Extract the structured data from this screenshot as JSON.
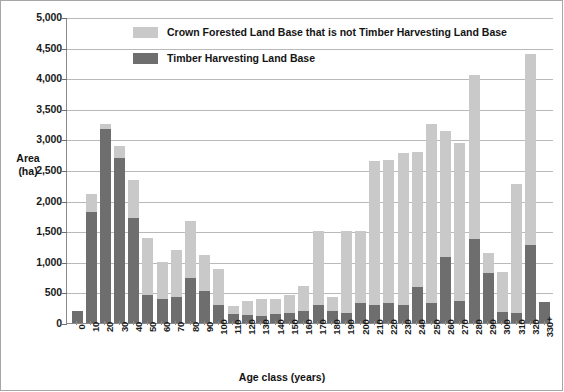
{
  "chart_data": {
    "type": "bar",
    "subtype": "stacked",
    "title": "",
    "xlabel": "Age class (years)",
    "ylabel": "Area\n(ha)",
    "ylabel_line1": "Area",
    "ylabel_line2": "(ha)",
    "ylim": [
      0,
      5000
    ],
    "ytick_step": 500,
    "grid": "horizontal",
    "legend_position": "inside-top-left",
    "ytick_labels": [
      "5,000",
      "4,500",
      "4,000",
      "3,500",
      "3,000",
      "2,500",
      "2,000",
      "1,500",
      "1,000",
      "500",
      "0"
    ],
    "ytick_values": [
      5000,
      4500,
      4000,
      3500,
      3000,
      2500,
      2000,
      1500,
      1000,
      500,
      0
    ],
    "categories": [
      "0",
      "10",
      "20",
      "30",
      "40",
      "50",
      "60",
      "70",
      "80",
      "90",
      "100",
      "110",
      "120",
      "130",
      "140",
      "150",
      "160",
      "170",
      "180",
      "190",
      "200",
      "210",
      "220",
      "230",
      "240",
      "250",
      "260",
      "270",
      "280",
      "290",
      "300",
      "310",
      "320",
      "330+"
    ],
    "series": [
      {
        "name": "Timber Harvesting Land Base",
        "color": "#6e6e6e",
        "values": [
          200,
          1810,
          3170,
          2690,
          1720,
          450,
          400,
          420,
          740,
          530,
          300,
          150,
          130,
          110,
          140,
          160,
          190,
          300,
          190,
          160,
          320,
          290,
          330,
          300,
          590,
          330,
          1080,
          360,
          1370,
          810,
          180,
          170,
          1280,
          350
        ]
      },
      {
        "name": "Crown Forested Land Base that is not Timber Harvesting Land Base",
        "color": "#c9c9c9",
        "values": [
          0,
          300,
          80,
          200,
          620,
          940,
          600,
          770,
          920,
          580,
          580,
          130,
          230,
          290,
          250,
          300,
          410,
          1200,
          230,
          1340,
          1180,
          2360,
          2330,
          2480,
          2200,
          2930,
          2050,
          2580,
          2690,
          330,
          650,
          2100,
          3110,
          0
        ]
      }
    ],
    "totals": [
      200,
      2110,
      3250,
      2890,
      2340,
      1390,
      1000,
      1190,
      1660,
      1110,
      880,
      280,
      360,
      400,
      390,
      460,
      600,
      1500,
      420,
      1500,
      1500,
      2650,
      2660,
      2780,
      2790,
      3260,
      3130,
      2940,
      4060,
      1140,
      830,
      2270,
      4390,
      350
    ]
  },
  "legend": {
    "items": [
      {
        "label": "Crown Forested Land Base that is not Timber Harvesting Land Base",
        "swatch": "crown"
      },
      {
        "label": "Timber Harvesting Land Base",
        "swatch": "thlb"
      }
    ],
    "item0_label": "Crown Forested Land Base that is not Timber Harvesting Land Base",
    "item1_label": "Timber Harvesting Land Base"
  },
  "axes": {
    "x_title": "Age class (years)",
    "y_title_line1": "Area",
    "y_title_line2": "(ha)"
  },
  "colors": {
    "crown_forested": "#c9c9c9",
    "timber_harvesting": "#6e6e6e",
    "gridline": "#b9b9b9",
    "axis": "#8a8a8a",
    "text": "#1a1a1a",
    "background": "#ffffff"
  }
}
